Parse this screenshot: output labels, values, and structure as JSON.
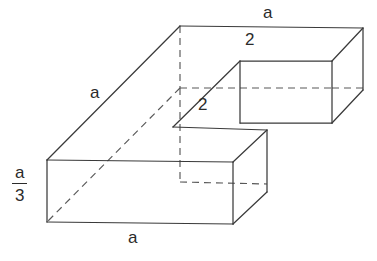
{
  "figure": {
    "kind": "3d-solid-dimension-diagram",
    "line_color": "#3a3a3a",
    "hidden_line_color": "#585858",
    "background_color": "#ffffff",
    "labels": [
      {
        "id": "top-depth",
        "text": "a",
        "x": 263,
        "y": 4
      },
      {
        "id": "left-slant",
        "text": "a",
        "x": 90,
        "y": 84
      },
      {
        "id": "notch-top",
        "text": "2",
        "x": 245,
        "y": 31
      },
      {
        "id": "notch-front",
        "text": "2",
        "x": 198,
        "y": 96
      },
      {
        "id": "bottom-width",
        "text": "a",
        "x": 128,
        "y": 229
      }
    ],
    "fraction_label": {
      "id": "height",
      "numerator": "a",
      "denominator": "3",
      "x": 12,
      "y": 164
    },
    "solid_paths": [
      "M 180 26 L 363 28",
      "M 180 26 L 47 160",
      "M 47 160 L 47 222",
      "M 47 222 L 233 224",
      "M 233 224 L 233 162",
      "M 233 162 L 47 160",
      "M 233 224 L 267 192",
      "M 267 192 L 267 130",
      "M 267 130 L 233 162",
      "M 173 127 L 267 130",
      "M 173 127 L 240 61",
      "M 240 61 L 332 61",
      "M 332 61 L 363 28",
      "M 240 61 L 240 123",
      "M 240 123 L 332 123",
      "M 332 123 L 332 61",
      "M 332 123 L 363 90",
      "M 363 90 L 363 28"
    ],
    "hidden_paths": [
      "M 180 26 L 180 88",
      "M 180 88 L 240 88",
      "M 332 88 L 363 88",
      "M 180 88 L 47 222",
      "M 180 88 L 180 150",
      "M 180 150 L 233 150",
      "M 240 123 L 267 100",
      "M 180 150 L 233 150"
    ]
  }
}
